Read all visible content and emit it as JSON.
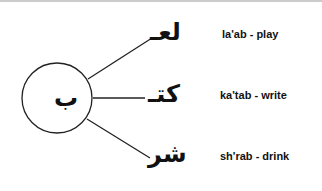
{
  "diagram": {
    "root_letter": "ب",
    "branches": [
      {
        "arabic": "لعـ",
        "gloss": "la'ab - play"
      },
      {
        "arabic": "كتـ",
        "gloss": "ka'tab - write"
      },
      {
        "arabic": "شر",
        "gloss": "sh'rab - drink"
      }
    ]
  }
}
